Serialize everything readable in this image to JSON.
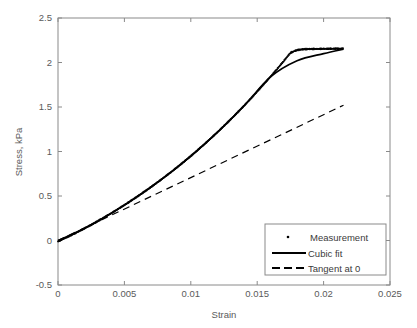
{
  "chart_data": {
    "type": "line",
    "title": "",
    "xlabel": "Strain",
    "ylabel": "Stress, kPa",
    "xlim": [
      0,
      0.025
    ],
    "ylim": [
      -0.5,
      2.5
    ],
    "xticks": [
      "0",
      "0.005",
      "0.01",
      "0.015",
      "0.02",
      "0.025"
    ],
    "xtick_values": [
      0,
      0.005,
      0.01,
      0.015,
      0.02,
      0.025
    ],
    "yticks": [
      "-0.5",
      "0",
      "0.5",
      "1",
      "1.5",
      "2",
      "2.5"
    ],
    "ytick_values": [
      -0.5,
      0,
      0.5,
      1,
      1.5,
      2,
      2.5
    ],
    "grid": false,
    "legend_position": "lower right",
    "series": [
      {
        "name": "Measurement",
        "style": "dotted-markers",
        "marker": ".",
        "color": "#000000",
        "x": [
          0.0,
          0.0005,
          0.001,
          0.0015,
          0.002,
          0.0025,
          0.003,
          0.0035,
          0.004,
          0.0045,
          0.005,
          0.0055,
          0.006,
          0.0065,
          0.007,
          0.0075,
          0.008,
          0.0085,
          0.009,
          0.0095,
          0.01,
          0.0105,
          0.011,
          0.0115,
          0.012,
          0.0125,
          0.013,
          0.0135,
          0.014,
          0.0145,
          0.015,
          0.0155,
          0.016,
          0.0165,
          0.017,
          0.0175,
          0.018,
          0.0185,
          0.019,
          0.0195,
          0.02,
          0.0205,
          0.021,
          0.0215
        ],
        "y": [
          -0.01,
          0.025,
          0.06,
          0.098,
          0.137,
          0.177,
          0.219,
          0.262,
          0.306,
          0.352,
          0.399,
          0.447,
          0.497,
          0.548,
          0.601,
          0.655,
          0.711,
          0.768,
          0.827,
          0.888,
          0.95,
          1.014,
          1.08,
          1.147,
          1.217,
          1.288,
          1.361,
          1.436,
          1.513,
          1.592,
          1.673,
          1.756,
          1.841,
          1.928,
          2.017,
          2.109,
          2.14,
          2.15,
          2.152,
          2.153,
          2.154,
          2.155,
          2.155,
          2.156
        ]
      },
      {
        "name": "Cubic fit",
        "style": "solid",
        "color": "#000000",
        "x": [
          0.0,
          0.002,
          0.004,
          0.006,
          0.008,
          0.01,
          0.012,
          0.014,
          0.016,
          0.018,
          0.02,
          0.0215
        ],
        "y": [
          0.0,
          0.136,
          0.305,
          0.496,
          0.71,
          0.949,
          1.215,
          1.511,
          1.838,
          2.02,
          2.1,
          2.15
        ]
      },
      {
        "name": "Tangent at 0",
        "style": "dashed",
        "color": "#000000",
        "x": [
          0.0,
          0.0215
        ],
        "y": [
          0.0,
          1.52
        ]
      }
    ]
  },
  "legend": {
    "items": [
      {
        "label": "Measurement",
        "marker": "dot"
      },
      {
        "label": "Cubic fit",
        "marker": "solid-line"
      },
      {
        "label": "Tangent at 0",
        "marker": "dashed-line"
      }
    ]
  },
  "axes": {
    "frame_color": "#7a7a7a",
    "text_color": "#5a5a5a",
    "background": "#ffffff"
  }
}
